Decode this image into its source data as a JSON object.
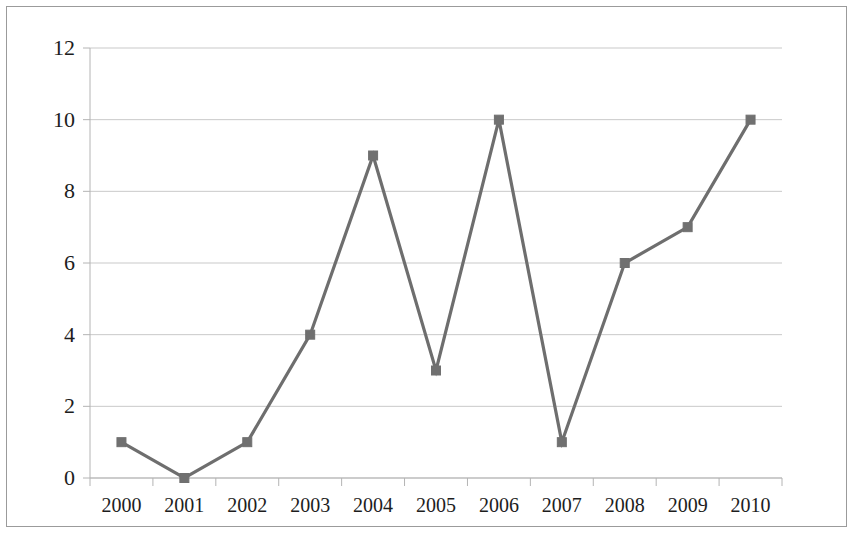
{
  "chart_data": {
    "type": "line",
    "title": "",
    "subtitle": "",
    "xlabel": "",
    "ylabel": "",
    "categories": [
      "2000",
      "2001",
      "2002",
      "2003",
      "2004",
      "2005",
      "2006",
      "2007",
      "2008",
      "2009",
      "2010"
    ],
    "series": [
      {
        "name": "Series 1",
        "values": [
          1,
          0,
          1,
          4,
          9,
          3,
          10,
          1,
          6,
          7,
          10
        ],
        "line_color": "#6e6e6e",
        "marker_color": "#707070",
        "marker_shape": "square"
      }
    ],
    "ylim": [
      0,
      12
    ],
    "y_ticks": [
      0,
      2,
      4,
      6,
      8,
      10,
      12
    ],
    "y_tick_labels": [
      "0",
      "2",
      "4",
      "6",
      "8",
      "10",
      "12"
    ],
    "x_tick_labels": [
      "2000",
      "2001",
      "2002",
      "2003",
      "2004",
      "2005",
      "2006",
      "2007",
      "2008",
      "2009",
      "2010"
    ],
    "grid": {
      "horizontal": true,
      "vertical": false,
      "color": "#c9c9c9"
    },
    "legend": {
      "visible": false,
      "position": "none",
      "entries": []
    },
    "axis_color": "#b4b4b4",
    "plot_background": "#ffffff",
    "frame_border_color": "#9b9b9b",
    "annotations": []
  },
  "figure": {
    "background_color": "#ffffff",
    "border_visible": true
  }
}
